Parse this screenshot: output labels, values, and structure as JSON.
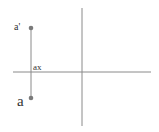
{
  "diagram": {
    "labels": {
      "a_prime": "a'",
      "ax": "ax",
      "a": "a"
    },
    "colors": {
      "line": "#8a8a8a",
      "point": "#7a7a7a",
      "text": "#333333",
      "background": "#ffffff"
    }
  }
}
